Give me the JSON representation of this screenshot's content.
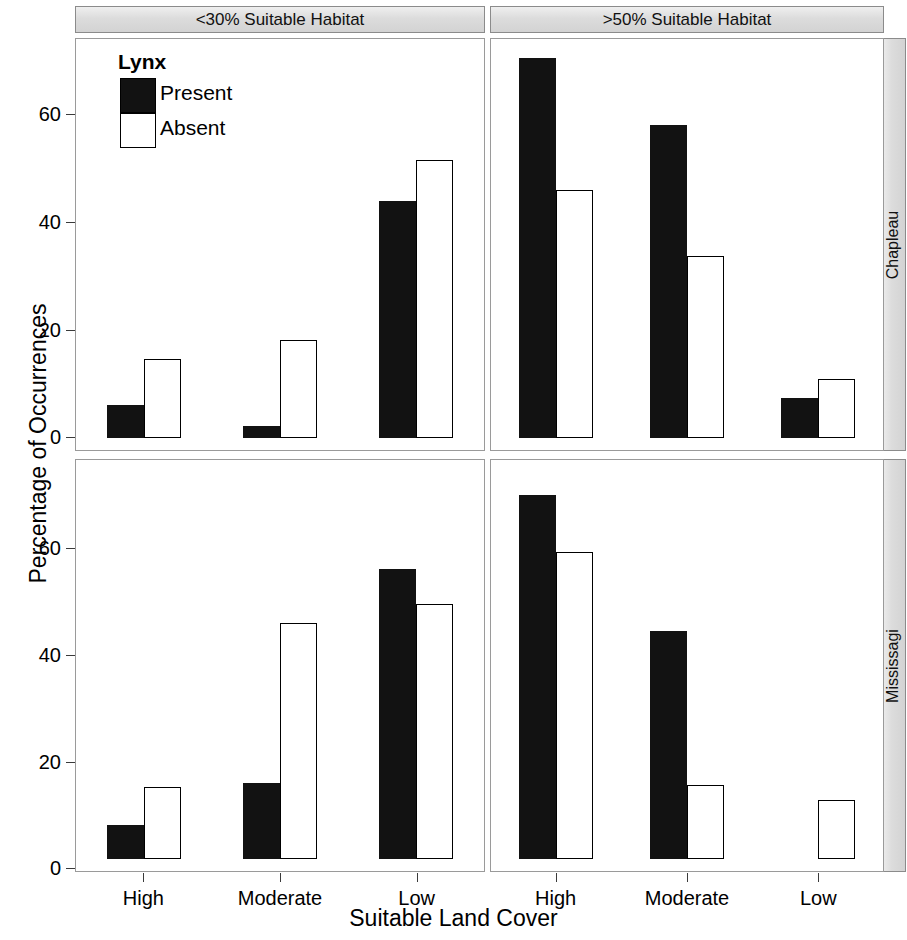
{
  "chart_data": {
    "type": "bar",
    "title": "",
    "xlabel": "Suitable Land Cover",
    "ylabel": "Percentage of Occurrences",
    "ylim": [
      0,
      75
    ],
    "yticks": [
      0,
      20,
      40,
      60
    ],
    "ytick_labels": [
      "0",
      "20",
      "40",
      "60"
    ],
    "grid": false,
    "categories": [
      "High",
      "Moderate",
      "Low"
    ],
    "legend": {
      "title": "Lynx",
      "position": "top-left inside first panel",
      "entries": [
        {
          "name": "Present",
          "color": "#121212",
          "fill": "solid-black"
        },
        {
          "name": "Absent",
          "color": "#ffffff",
          "fill": "white-outline"
        }
      ]
    },
    "facet_columns": [
      "<30% Suitable Habitat",
      ">50% Suitable Habitat"
    ],
    "facet_rows": [
      "Chapleau",
      "Mississagi"
    ],
    "panels": [
      {
        "row": "Chapleau",
        "column": "<30% Suitable Habitat",
        "categories": [
          "High",
          "Moderate",
          "Low"
        ],
        "series": [
          {
            "name": "Present",
            "values": [
              6.2,
              2.2,
              44.5
            ]
          },
          {
            "name": "Absent",
            "values": [
              14.9,
              18.4,
              52.2
            ]
          }
        ]
      },
      {
        "row": "Chapleau",
        "column": ">50% Suitable Habitat",
        "categories": [
          "High",
          "Moderate",
          "Low"
        ],
        "series": [
          {
            "name": "Present",
            "values": [
              71.5,
              58.9,
              7.5
            ]
          },
          {
            "name": "Absent",
            "values": [
              46.7,
              34.3,
              11.0
            ]
          }
        ]
      },
      {
        "row": "Mississagi",
        "column": "<30% Suitable Habitat",
        "categories": [
          "High",
          "Moderate",
          "Low"
        ],
        "series": [
          {
            "name": "Present",
            "values": [
              6.3,
              14.3,
              54.6
            ]
          },
          {
            "name": "Absent",
            "values": [
              13.6,
              44.3,
              48.0
            ]
          }
        ]
      },
      {
        "row": "Mississagi",
        "column": ">50% Suitable Habitat",
        "categories": [
          "High",
          "Moderate",
          "Low"
        ],
        "series": [
          {
            "name": "Present",
            "values": [
              68.5,
              42.8,
              0.0
            ]
          },
          {
            "name": "Absent",
            "values": [
              57.7,
              14.0,
              11.1
            ]
          }
        ]
      }
    ],
    "colors": {
      "present": "#121212",
      "absent": "#ffffff",
      "outline": "#000000",
      "strip_background": "#d9d9d9",
      "panel_border": "#9a9a9a"
    }
  },
  "axis": {
    "y_title": "Percentage of Occurrences",
    "x_title": "Suitable Land Cover",
    "y_ticks": [
      "0",
      "20",
      "40",
      "60"
    ],
    "x_ticks": [
      "High",
      "Moderate",
      "Low"
    ]
  },
  "strips": {
    "col_left": "<30% Suitable Habitat",
    "col_right": ">50% Suitable Habitat",
    "row_top": "Chapleau",
    "row_bottom": "Mississagi"
  },
  "legend": {
    "title": "Lynx",
    "present": "Present",
    "absent": "Absent"
  }
}
